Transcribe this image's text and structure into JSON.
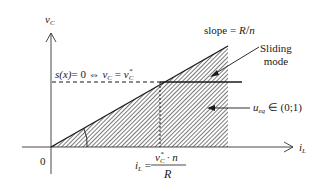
{
  "diagram": {
    "axes": {
      "y_label": "v",
      "y_label_sub": "C",
      "x_label": "i",
      "x_label_sub": "L",
      "origin_label": "0"
    },
    "slope_label": {
      "prefix": "slope = ",
      "numerator": "R",
      "slash": "/",
      "denominator": "n"
    },
    "sliding_mode_label": {
      "line1": "Sliding",
      "line2": "mode"
    },
    "surface_label": {
      "lhs": "s(x)",
      "eq": "= 0 ⇔ ",
      "v": "v",
      "v_sub": "C",
      "eq2": " = ",
      "v2": "v",
      "v2_sub": "C",
      "v2_sup": "*"
    },
    "ueq_label": {
      "u": "u",
      "u_sub": "eq",
      "rest": " ∈ (0;1)"
    },
    "il_formula": {
      "lhs": "i",
      "lhs_sub": "L",
      "eq": " = ",
      "num_v": "v",
      "num_sub": "C",
      "num_sup": "*",
      "num_rest": " · n",
      "den": "R"
    },
    "colors": {
      "line": "#1a1a1a",
      "hatch": "#333333",
      "background": "#ffffff"
    }
  }
}
